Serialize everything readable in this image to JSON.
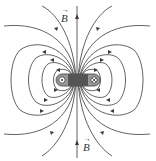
{
  "diagram": {
    "labels": {
      "top_field": "B",
      "bottom_field": "B",
      "vector_arrow": "→"
    },
    "symbols": {
      "left_current": "dot (out of page)",
      "right_current": "cross (into page)"
    },
    "colors": {
      "line": "#3a3a3a",
      "coil_fill": "#9a9a9a",
      "coil_dark": "#555555",
      "background": "#ffffff"
    }
  }
}
